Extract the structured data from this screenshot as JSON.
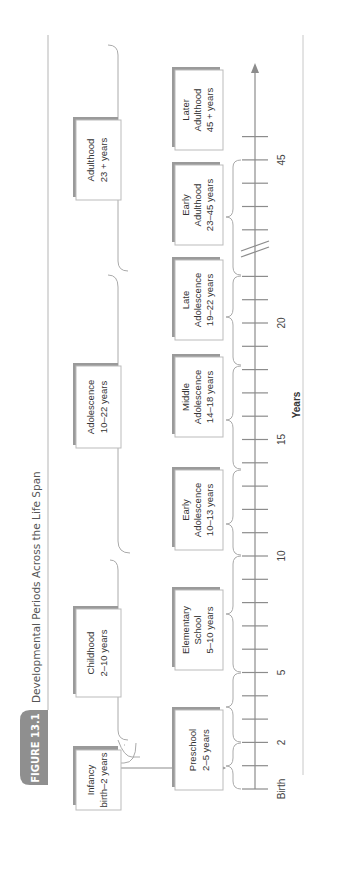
{
  "figure": {
    "label": "FIGURE 13.1",
    "title": "Developmental Periods Across the Life Span",
    "label_color": "#8a8a8a",
    "rule_color": "#b5b5b5"
  },
  "axis": {
    "title": "Years",
    "tick_labels": [
      {
        "text": "Birth",
        "tick": 0
      },
      {
        "text": "2",
        "tick": 2
      },
      {
        "text": "5",
        "tick": 5
      },
      {
        "text": "10",
        "tick": 10
      },
      {
        "text": "15",
        "tick": 15
      },
      {
        "text": "20",
        "tick": 20
      },
      {
        "text": "45",
        "tick": 26
      }
    ],
    "break_after_tick": 23,
    "color": "#8c8c8c"
  },
  "periods": {
    "top": [
      {
        "name": "Infancy",
        "range": "birth–2 years"
      },
      {
        "name": "Childhood",
        "range": "2–10 years"
      },
      {
        "name": "Adolescence",
        "range": "10–22 years"
      },
      {
        "name": "Adulthood",
        "range": "23 + years"
      }
    ],
    "sub": [
      {
        "lines": [
          "Preschool",
          "2–5 years"
        ]
      },
      {
        "lines": [
          "Elementary",
          "School",
          "5–10 years"
        ]
      },
      {
        "lines": [
          "Early",
          "Adolescence",
          "10–13 years"
        ]
      },
      {
        "lines": [
          "Middle",
          "Adolescence",
          "14–18 years"
        ]
      },
      {
        "lines": [
          "Late",
          "Adolescence",
          "19–22 years"
        ]
      },
      {
        "lines": [
          "Early",
          "Adulthood",
          "23–45 years"
        ]
      },
      {
        "lines": [
          "Later",
          "Adulthood",
          "45 + years"
        ]
      }
    ]
  }
}
